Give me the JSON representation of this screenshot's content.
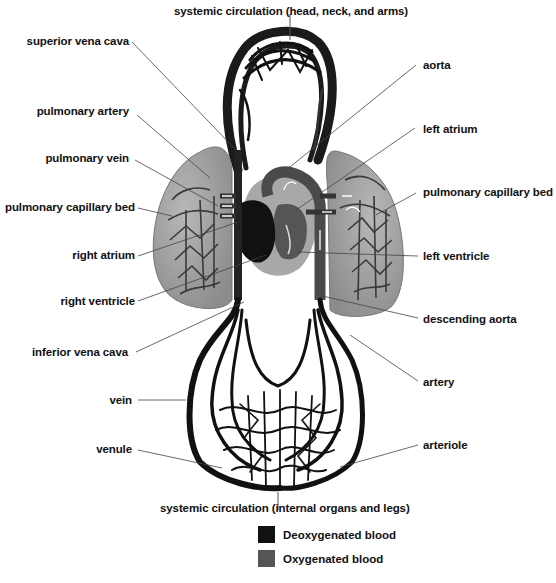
{
  "diagram": {
    "title_top": "systemic circulation (head, neck, and arms)",
    "title_bottom": "systemic circulation (internal organs and legs)",
    "labels_left": [
      {
        "id": "superior-vena-cava",
        "text": "superior vena cava"
      },
      {
        "id": "pulmonary-artery",
        "text": "pulmonary artery"
      },
      {
        "id": "pulmonary-vein",
        "text": "pulmonary vein"
      },
      {
        "id": "pulmonary-capillary-bed-left",
        "text": "pulmonary capillary bed"
      },
      {
        "id": "right-atrium",
        "text": "right atrium"
      },
      {
        "id": "right-ventricle",
        "text": "right ventricle"
      },
      {
        "id": "inferior-vena-cava",
        "text": "inferior vena cava"
      },
      {
        "id": "vein",
        "text": "vein"
      },
      {
        "id": "venule",
        "text": "venule"
      }
    ],
    "labels_right": [
      {
        "id": "aorta",
        "text": "aorta"
      },
      {
        "id": "left-atrium",
        "text": "left atrium"
      },
      {
        "id": "pulmonary-capillary-bed-right",
        "text": "pulmonary capillary bed"
      },
      {
        "id": "left-ventricle",
        "text": "left ventricle"
      },
      {
        "id": "descending-aorta",
        "text": "descending aorta"
      },
      {
        "id": "artery",
        "text": "artery"
      },
      {
        "id": "arteriole",
        "text": "arteriole"
      }
    ],
    "legend": [
      {
        "label": "Deoxygenated blood",
        "color": "#111111"
      },
      {
        "label": "Oxygenated blood",
        "color": "#555555"
      }
    ],
    "colors": {
      "deoxygenated": "#111111",
      "oxygenated": "#4a4a4a",
      "lung": "#9a9a9a",
      "heart_bg": "#a8a8a8"
    }
  }
}
